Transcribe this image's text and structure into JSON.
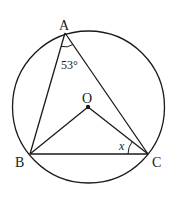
{
  "diagram": {
    "points": {
      "A": {
        "label": "A",
        "x": 65,
        "y": 33
      },
      "B": {
        "label": "B",
        "x": 30,
        "y": 154
      },
      "C": {
        "label": "C",
        "x": 148,
        "y": 154
      },
      "O": {
        "label": "O",
        "x": 88,
        "y": 107
      }
    },
    "circle": {
      "cx": 88.5,
      "cy": 107,
      "r": 76
    },
    "segments": [
      "AB",
      "AC",
      "BC",
      "OB",
      "OC"
    ],
    "angles": {
      "A": {
        "label": "53°",
        "vertex": "A"
      },
      "OCB": {
        "label": "x",
        "vertex": "C"
      }
    },
    "colors": {
      "stroke": "#1a1a1a",
      "background": "#ffffff"
    }
  }
}
